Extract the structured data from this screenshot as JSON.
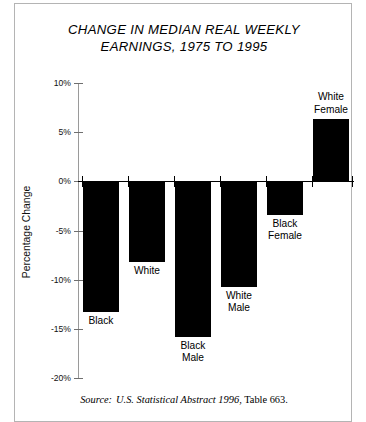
{
  "figure": {
    "title_line1": "CHANGE IN MEDIAN REAL WEEKLY",
    "title_line2": "EARNINGS, 1975 TO 1995",
    "source_prefix": "Source:",
    "source_italic": "U.S. Statistical Abstract 1996",
    "source_rest": ", Table 663."
  },
  "chart_data": {
    "type": "bar",
    "title": "CHANGE IN MEDIAN REAL WEEKLY EARNINGS, 1975 TO 1995",
    "xlabel": "",
    "ylabel": "Percentage Change",
    "ylim": [
      -20,
      10
    ],
    "ytick_labels": [
      "10%",
      "5%",
      "0%",
      "-5%",
      "-10%",
      "-15%",
      "-20%"
    ],
    "ytick_values": [
      10,
      5,
      0,
      -5,
      -10,
      -15,
      -20
    ],
    "grid": false,
    "legend": false,
    "categories": [
      "Black",
      "White",
      "Black Male",
      "White Male",
      "Black Female",
      "White Female"
    ],
    "category_labels": [
      [
        "Black"
      ],
      [
        "White"
      ],
      [
        "Black",
        "Male"
      ],
      [
        "White",
        "Male"
      ],
      [
        "Black",
        "Female"
      ],
      [
        "White",
        "Female"
      ]
    ],
    "values": [
      -13.3,
      -8.2,
      -15.8,
      -10.7,
      -3.4,
      6.3
    ],
    "bar_color": "#000000",
    "source": "Source: U.S. Statistical Abstract 1996, Table 663."
  }
}
